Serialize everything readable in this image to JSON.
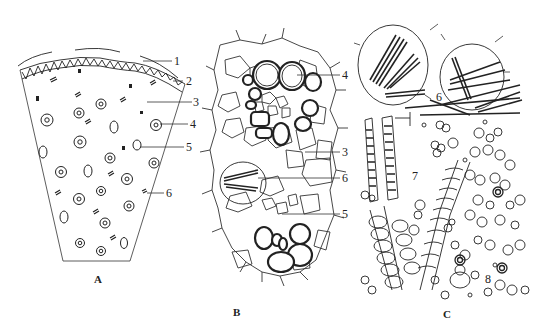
{
  "figure": {
    "panels": [
      {
        "id": "A",
        "label": "A",
        "description": "Transverse section sketch (sector)",
        "callouts": [
          "1",
          "2",
          "3",
          "4",
          "5",
          "6"
        ]
      },
      {
        "id": "B",
        "label": "B",
        "description": "Detail of tissue with vascular bundle and raphide cell",
        "callouts": [
          "4",
          "3",
          "6",
          "5"
        ]
      },
      {
        "id": "C",
        "label": "C",
        "description": "Powder characteristics",
        "callouts": [
          "6",
          "7",
          "8"
        ]
      }
    ],
    "labels": {
      "A": {
        "panel": "A",
        "c1": "1",
        "c2": "2",
        "c3": "3",
        "c4": "4",
        "c5": "5",
        "c6": "6"
      },
      "B": {
        "panel": "B",
        "c4": "4",
        "c3": "3",
        "c6": "6",
        "c5": "5"
      },
      "C": {
        "panel": "C",
        "c6": "6",
        "c7": "7",
        "c8": "8"
      }
    },
    "colors": {
      "background": "#ffffff",
      "ink": "#222222"
    }
  }
}
